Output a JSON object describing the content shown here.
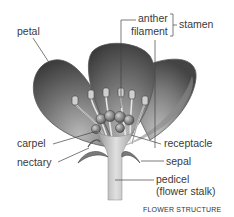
{
  "diagram": {
    "title": "FLOWER STRUCTURE",
    "labels": {
      "petal": "petal",
      "anther": "anther",
      "filament": "filament",
      "stamen": "stamen",
      "carpel": "carpel",
      "nectary": "nectary",
      "receptacle": "receptacle",
      "sepal": "sepal",
      "pedicel": "pedicel",
      "pedicel_note": "(flower stalk)"
    },
    "colors": {
      "petal_dark": "#3c3c3c",
      "petal_light": "#a8a8a8",
      "stalk": "#c8c8c8",
      "leader_line": "#444444",
      "text": "#3a3a3a"
    }
  }
}
